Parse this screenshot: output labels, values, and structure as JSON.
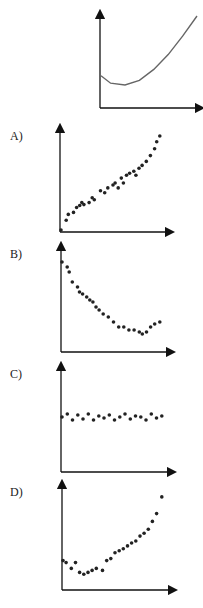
{
  "chart_data": [
    {
      "id": "reference",
      "type": "line",
      "label": "",
      "title": "",
      "xlabel": "",
      "ylabel": "",
      "description": "U-shaped curve: starts mid-height, dips to a minimum early, then rises steeply",
      "x": [
        0,
        0.1,
        0.25,
        0.4,
        0.55,
        0.7,
        0.85,
        1.0
      ],
      "values": [
        0.35,
        0.27,
        0.25,
        0.3,
        0.42,
        0.58,
        0.78,
        1.0
      ]
    },
    {
      "id": "A",
      "type": "scatter",
      "label": "A)",
      "description": "Roughly linear increasing scatter",
      "x": [
        0.0,
        0.05,
        0.07,
        0.12,
        0.15,
        0.18,
        0.2,
        0.22,
        0.27,
        0.3,
        0.32,
        0.38,
        0.42,
        0.45,
        0.5,
        0.52,
        0.55,
        0.58,
        0.6,
        0.63,
        0.66,
        0.7,
        0.72,
        0.75,
        0.78,
        0.82,
        0.86,
        0.9,
        0.92,
        0.95
      ],
      "values": [
        0.02,
        0.12,
        0.18,
        0.2,
        0.25,
        0.27,
        0.3,
        0.28,
        0.3,
        0.35,
        0.33,
        0.42,
        0.4,
        0.45,
        0.48,
        0.5,
        0.45,
        0.55,
        0.5,
        0.58,
        0.6,
        0.62,
        0.58,
        0.65,
        0.68,
        0.72,
        0.78,
        0.85,
        0.92,
        0.98
      ]
    },
    {
      "id": "B",
      "type": "scatter",
      "label": "B)",
      "description": "Decreasing scatter with slight upturn at the end",
      "x": [
        0.0,
        0.05,
        0.07,
        0.1,
        0.15,
        0.17,
        0.2,
        0.24,
        0.27,
        0.3,
        0.33,
        0.36,
        0.4,
        0.45,
        0.5,
        0.55,
        0.6,
        0.65,
        0.7,
        0.75,
        0.78,
        0.82,
        0.86,
        0.9,
        0.95
      ],
      "values": [
        0.9,
        0.85,
        0.8,
        0.7,
        0.65,
        0.6,
        0.58,
        0.55,
        0.52,
        0.5,
        0.45,
        0.42,
        0.38,
        0.35,
        0.3,
        0.25,
        0.25,
        0.22,
        0.22,
        0.2,
        0.18,
        0.2,
        0.25,
        0.28,
        0.3
      ]
    },
    {
      "id": "C",
      "type": "scatter",
      "label": "C)",
      "description": "Flat horizontal band of points, no trend",
      "x": [
        0.0,
        0.05,
        0.1,
        0.15,
        0.2,
        0.25,
        0.3,
        0.35,
        0.4,
        0.45,
        0.5,
        0.55,
        0.6,
        0.65,
        0.7,
        0.75,
        0.8,
        0.85,
        0.9,
        0.95
      ],
      "values": [
        0.55,
        0.58,
        0.52,
        0.57,
        0.53,
        0.58,
        0.52,
        0.56,
        0.54,
        0.57,
        0.52,
        0.55,
        0.58,
        0.53,
        0.56,
        0.55,
        0.52,
        0.58,
        0.54,
        0.56
      ]
    },
    {
      "id": "D",
      "type": "scatter",
      "label": "D)",
      "description": "U-shaped scatter: slight dip early then steep rise",
      "x": [
        0.0,
        0.03,
        0.08,
        0.12,
        0.16,
        0.2,
        0.24,
        0.28,
        0.32,
        0.38,
        0.42,
        0.46,
        0.5,
        0.54,
        0.58,
        0.62,
        0.66,
        0.7,
        0.74,
        0.78,
        0.82,
        0.86,
        0.9,
        0.95
      ],
      "values": [
        0.3,
        0.28,
        0.22,
        0.28,
        0.18,
        0.16,
        0.18,
        0.2,
        0.22,
        0.2,
        0.3,
        0.32,
        0.38,
        0.4,
        0.42,
        0.45,
        0.48,
        0.5,
        0.55,
        0.58,
        0.62,
        0.7,
        0.78,
        0.95
      ]
    }
  ],
  "labels": {
    "a": "A)",
    "b": "B)",
    "c": "C)",
    "d": "D)"
  }
}
